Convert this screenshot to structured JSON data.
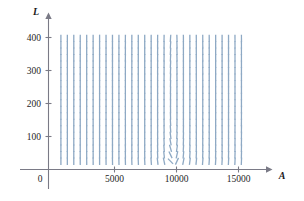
{
  "figure": {
    "type": "slope-field",
    "background": "#ffffff",
    "segment_color": "#8ea9c4",
    "axis_color": "#7a7a86"
  },
  "axes": {
    "x": {
      "name": "A",
      "ticks": [
        {
          "value": 5000,
          "label": "5000"
        },
        {
          "value": 10000,
          "label": "10000"
        },
        {
          "value": 15000,
          "label": "15000"
        }
      ],
      "range": [
        0,
        17400
      ],
      "origin_label": "0"
    },
    "y": {
      "name": "L",
      "ticks": [
        {
          "value": 100,
          "label": "100"
        },
        {
          "value": 200,
          "label": "200"
        },
        {
          "value": 300,
          "label": "300"
        },
        {
          "value": 400,
          "label": "400"
        }
      ],
      "range": [
        0,
        460
      ]
    }
  },
  "chart_data": {
    "type": "scatter",
    "title": "",
    "xlabel": "A",
    "ylabel": "L",
    "xlim": [
      0,
      17400
    ],
    "ylim": [
      0,
      460
    ],
    "grid": false,
    "legend": null,
    "xticks": [
      5000,
      10000,
      15000
    ],
    "yticks": [
      100,
      200,
      300,
      400
    ],
    "xticklabels": [
      "5000",
      "10000",
      "15000"
    ],
    "yticklabels": [
      "100",
      "200",
      "300",
      "400"
    ],
    "field": {
      "description": "Direction field of a predator-prey (Lotka-Volterra type) system dL/dA, rotating counter-clockwise about an equilibrium center",
      "center": {
        "A": 10000,
        "L": 200
      },
      "x_start": 1000,
      "x_step": 520,
      "x_count": 29,
      "y_start": 25,
      "y_step": 19.6,
      "y_count": 20,
      "segment_length_px": 7.4,
      "segment_width_px": 1.3,
      "color": "#8ea9c4",
      "model": {
        "dA_dt_coeff": 0.13,
        "dA_dt_center": 200,
        "dL_dt_coeff": 0.00011,
        "dL_dt_center": 10000
      }
    }
  }
}
